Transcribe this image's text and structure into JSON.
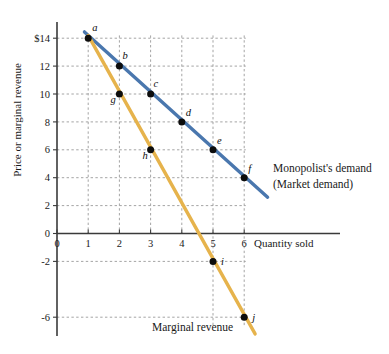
{
  "chart_data": {
    "type": "line",
    "title": "",
    "xlabel": "Quantity sold",
    "ylabel": "Price or marginal revenue",
    "xlim": [
      0,
      7.2
    ],
    "ylim": [
      -7.5,
      15.2
    ],
    "grid": true,
    "legend_position": "right",
    "x_ticks": [
      "0",
      "1",
      "2",
      "3",
      "4",
      "5",
      "6"
    ],
    "x_tick_values": [
      0,
      1,
      2,
      3,
      4,
      5,
      6
    ],
    "y_ticks": [
      "$14",
      "12",
      "10",
      "8",
      "6",
      "4",
      "2",
      "0",
      "-2",
      "-6"
    ],
    "y_tick_values": [
      14,
      12,
      10,
      8,
      6,
      4,
      2,
      0,
      -2,
      -6
    ],
    "series": [
      {
        "name": "Monopolist's demand (Market demand)",
        "color": "#4A77AE",
        "x": [
          1,
          2,
          3,
          4,
          5,
          6
        ],
        "values": [
          14,
          12,
          10,
          8,
          6,
          4
        ],
        "point_labels": [
          "a",
          "b",
          "c",
          "d",
          "e",
          "f"
        ],
        "line_start": [
          0.88,
          14.45
        ],
        "line_end": [
          6.75,
          2.6
        ]
      },
      {
        "name": "Marginal revenue",
        "color": "#E6B34C",
        "x": [
          1,
          2,
          3,
          5,
          6
        ],
        "values": [
          14,
          10,
          6,
          -2,
          -6
        ],
        "point_labels": [
          "a",
          "g",
          "h",
          "i",
          "j"
        ],
        "line_start": [
          1.0,
          14.2
        ],
        "line_end": [
          6.35,
          -7.2
        ]
      }
    ],
    "annotations": [
      {
        "text": "Monopolist's demand",
        "x": 273,
        "y": 172
      },
      {
        "text": "(Market demand)",
        "x": 273,
        "y": 188
      },
      {
        "text": "Marginal revenue",
        "x": 152,
        "y": 331
      }
    ]
  },
  "axis_titles": {
    "x": "Quantity sold",
    "y": "Price or marginal revenue"
  }
}
